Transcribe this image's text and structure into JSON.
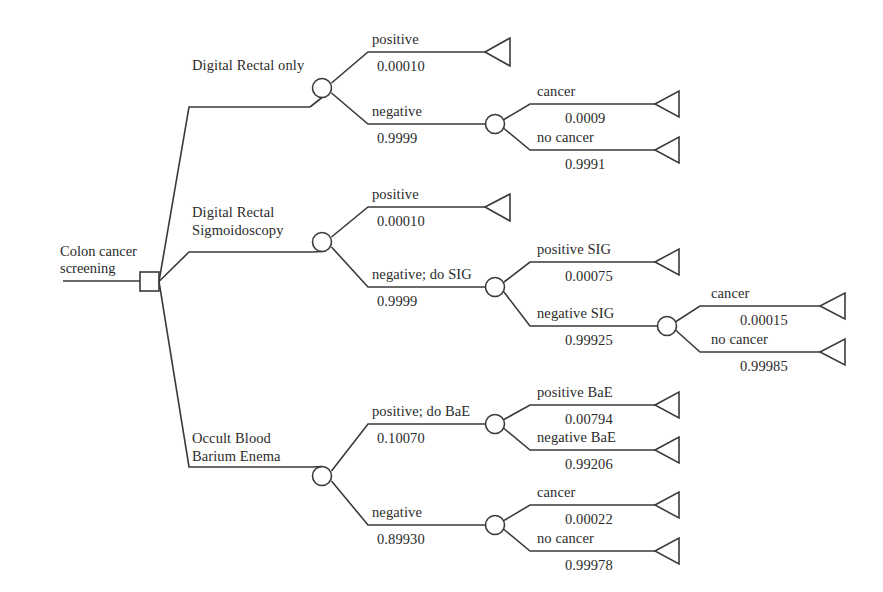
{
  "diagram": {
    "root": {
      "label_line1": "Colon cancer",
      "label_line2": "screening",
      "node_type": "decision-square"
    },
    "colors": {
      "stroke": "#3a3a3a",
      "text": "#2b2b2b",
      "background": "#ffffff"
    },
    "strategies": [
      {
        "id": "digital-rectal-only",
        "label": "Digital Rectal only",
        "label_lines": [
          "Digital Rectal only"
        ],
        "branches": [
          {
            "id": "dr-positive",
            "label": "positive",
            "probability": "0.00010",
            "terminal": true
          },
          {
            "id": "dr-negative",
            "label": "negative",
            "probability": "0.9999",
            "terminal": false,
            "children": [
              {
                "id": "dr-neg-cancer",
                "label": "cancer",
                "probability": "0.0009",
                "terminal": true
              },
              {
                "id": "dr-neg-no-cancer",
                "label": "no cancer",
                "probability": "0.9991",
                "terminal": true
              }
            ]
          }
        ]
      },
      {
        "id": "digital-rectal-sigmoidoscopy",
        "label": "Digital Rectal Sigmoidoscopy",
        "label_lines": [
          "Digital Rectal",
          "Sigmoidoscopy"
        ],
        "branches": [
          {
            "id": "drs-positive",
            "label": "positive",
            "probability": "0.00010",
            "terminal": true
          },
          {
            "id": "drs-negative-do-sig",
            "label": "negative; do SIG",
            "probability": "0.9999",
            "terminal": false,
            "children": [
              {
                "id": "sig-positive",
                "label": "positive SIG",
                "probability": "0.00075",
                "terminal": true
              },
              {
                "id": "sig-negative",
                "label": "negative SIG",
                "probability": "0.99925",
                "terminal": false,
                "children": [
                  {
                    "id": "sig-neg-cancer",
                    "label": "cancer",
                    "probability": "0.00015",
                    "terminal": true
                  },
                  {
                    "id": "sig-neg-no-cancer",
                    "label": "no cancer",
                    "probability": "0.99985",
                    "terminal": true
                  }
                ]
              }
            ]
          }
        ]
      },
      {
        "id": "occult-blood-barium-enema",
        "label": "Occult Blood Barium Enema",
        "label_lines": [
          "Occult Blood",
          "Barium Enema"
        ],
        "branches": [
          {
            "id": "ob-positive-do-bae",
            "label": "positive; do BaE",
            "probability": "0.10070",
            "terminal": false,
            "children": [
              {
                "id": "bae-positive",
                "label": "positive BaE",
                "probability": "0.00794",
                "terminal": true
              },
              {
                "id": "bae-negative",
                "label": "negative BaE",
                "probability": "0.99206",
                "terminal": true
              }
            ]
          },
          {
            "id": "ob-negative",
            "label": "negative",
            "probability": "0.89930",
            "terminal": false,
            "children": [
              {
                "id": "ob-neg-cancer",
                "label": "cancer",
                "probability": "0.00022",
                "terminal": true
              },
              {
                "id": "ob-neg-no-cancer",
                "label": "no cancer",
                "probability": "0.99978",
                "terminal": true
              }
            ]
          }
        ]
      }
    ]
  },
  "labels": {
    "root1": "Colon cancer",
    "root2": "screening",
    "s1_name": "Digital Rectal only",
    "s2_name1": "Digital Rectal",
    "s2_name2": "Sigmoidoscopy",
    "s3_name1": "Occult Blood",
    "s3_name2": "Barium Enema",
    "b1": "positive",
    "b1p": "0.00010",
    "b2": "negative",
    "b2p": "0.9999",
    "b3": "cancer",
    "b3p": "0.0009",
    "b4": "no cancer",
    "b4p": "0.9991",
    "b5": "positive",
    "b5p": "0.00010",
    "b6": "negative; do SIG",
    "b6p": "0.9999",
    "b7": "positive SIG",
    "b7p": "0.00075",
    "b8": "negative SIG",
    "b8p": "0.99925",
    "b9": "cancer",
    "b9p": "0.00015",
    "b10": "no cancer",
    "b10p": "0.99985",
    "b11": "positive; do BaE",
    "b11p": "0.10070",
    "b12": "positive BaE",
    "b12p": "0.00794",
    "b13": "negative BaE",
    "b13p": "0.99206",
    "b14": "negative",
    "b14p": "0.89930",
    "b15": "cancer",
    "b15p": "0.00022",
    "b16": "no cancer",
    "b16p": "0.99978"
  }
}
